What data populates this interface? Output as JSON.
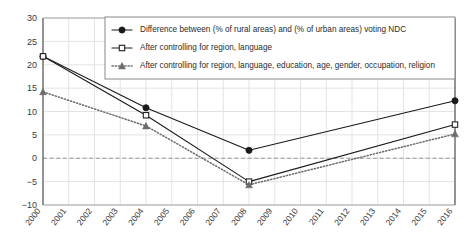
{
  "chart_data": {
    "type": "line",
    "title": "",
    "xlabel": "",
    "ylabel": "",
    "grid": true,
    "legend_position": "top-right-inside",
    "xlim": [
      2000,
      2016
    ],
    "ylim": [
      -10,
      30
    ],
    "ytick_step": 5,
    "zero_line": true,
    "categories": [
      "2000",
      "2001",
      "2002",
      "2003",
      "2004",
      "2005",
      "2006",
      "2007",
      "2008",
      "2009",
      "2010",
      "2011",
      "2012",
      "2013",
      "2014",
      "2015",
      "2016"
    ],
    "xticks": [
      "2000",
      "2001",
      "2002",
      "2003",
      "2004",
      "2005",
      "2006",
      "2007",
      "2008",
      "2009",
      "2010",
      "2011",
      "2012",
      "2013",
      "2014",
      "2015",
      "2016"
    ],
    "yticks": [
      "30",
      "25",
      "20",
      "15",
      "10",
      "5",
      "0",
      "-5",
      "-10"
    ],
    "marked_x": [
      2000,
      2004,
      2008,
      2016
    ],
    "series": [
      {
        "name": "Difference between (% of rural areas) and (% of urban areas) voting NDC",
        "marker": "filled-circle",
        "line": "solid",
        "color": "#1a1a1a",
        "x": [
          2000,
          2004,
          2008,
          2016
        ],
        "values": [
          21.8,
          10.8,
          1.7,
          12.3
        ]
      },
      {
        "name": "After controlling for region, language",
        "marker": "open-square",
        "line": "solid",
        "color": "#1a1a1a",
        "x": [
          2000,
          2004,
          2008,
          2016
        ],
        "values": [
          21.8,
          9.2,
          -5.0,
          7.2
        ]
      },
      {
        "name": "After controlling for region, language, education, age, gender, occupation, religion",
        "marker": "filled-triangle",
        "line": "dotted",
        "color": "#6b6b6b",
        "x": [
          2000,
          2004,
          2008,
          2016
        ],
        "values": [
          14.2,
          6.9,
          -5.7,
          5.2
        ]
      }
    ]
  },
  "legend": {
    "entries": [
      "Difference between (% of rural areas) and (% of urban areas) voting NDC",
      "After controlling for region, language",
      "After controlling for region, language, education, age, gender, occupation, religion"
    ]
  },
  "colors": {
    "axis": "#6f6f6f",
    "grid": "#e3e3e6",
    "zero_line": "#9a9a9a",
    "series_dark": "#1a1a1a",
    "series_gray": "#6b6b6b",
    "text": "#3a3a3a",
    "legend_border": "#888888",
    "background": "#ffffff"
  }
}
